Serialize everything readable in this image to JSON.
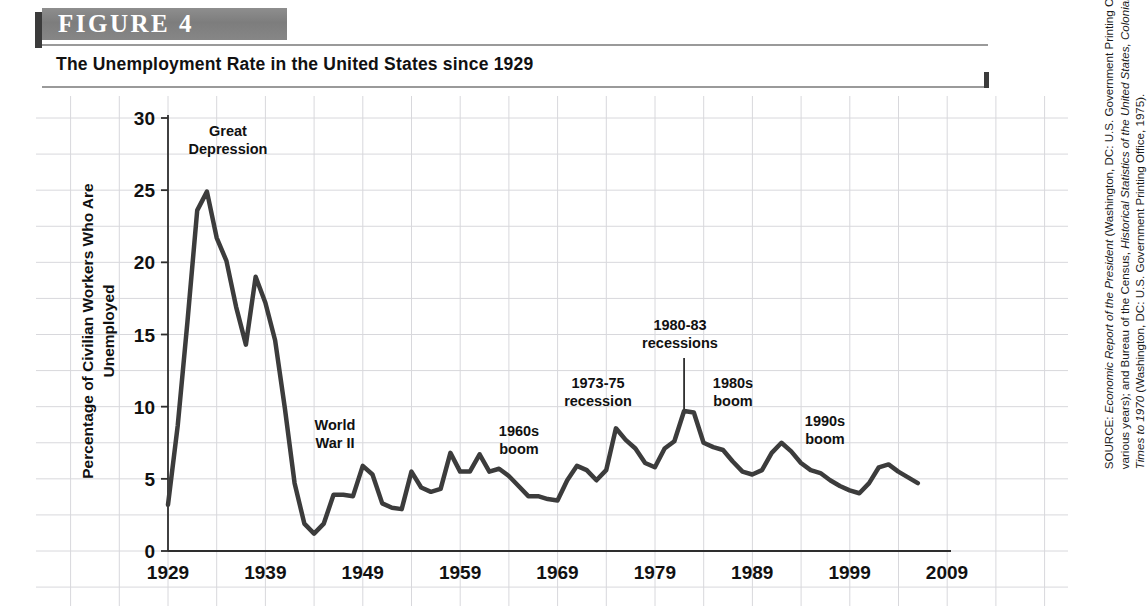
{
  "figure": {
    "label": "FIGURE   4",
    "title": "The Unemployment Rate in the United States since 1929",
    "header_band_color": "#7d7d7d",
    "header_tab_color": "#3b3b3b",
    "rule_color": "#9a9a9a"
  },
  "source": {
    "prefix": "SOURCE: ",
    "part1_italic": "Economic Report of the President",
    "part2": " (Washington, DC: U.S. Government Printing Office, various years); and Bureau of the Census, ",
    "part3_italic": "Historical Statistics of the United States, Colonial Times to 1970",
    "part4": " (Washington, DC: U.S. Government Printing Office, 1975)."
  },
  "annotations": {
    "great_depression": "Great\nDepression",
    "world_war_ii": "World\nWar II",
    "boom_1960s": "1960s\nboom",
    "recession_1973_75": "1973-75\nrecession",
    "recessions_1980_83": "1980-83\nrecessions",
    "boom_1980s": "1980s\nboom",
    "boom_1990s": "1990s\nboom"
  },
  "chart_data": {
    "type": "line",
    "title": "The Unemployment Rate in the United States since 1929",
    "xlabel": "",
    "ylabel": "Percentage of Civilian Workers Who Are Unemployed",
    "xlim": [
      1929,
      2009
    ],
    "ylim": [
      0,
      30
    ],
    "yticks": [
      0,
      5,
      10,
      15,
      20,
      25,
      30
    ],
    "ytick_labels": [
      "0",
      "5",
      "10",
      "15",
      "20",
      "25",
      "30"
    ],
    "xticks": [
      1929,
      1939,
      1949,
      1959,
      1969,
      1979,
      1989,
      1999,
      2009
    ],
    "xtick_labels": [
      "1929",
      "1939",
      "1949",
      "1959",
      "1969",
      "1979",
      "1989",
      "1999",
      "2009"
    ],
    "grid": true,
    "grid_color": "#d8d8dc",
    "line_color": "#3c3c3c",
    "line_width": 4.5,
    "legend": null,
    "series": [
      {
        "name": "Unemployment rate",
        "x": [
          1929,
          1930,
          1931,
          1932,
          1933,
          1934,
          1935,
          1936,
          1937,
          1938,
          1939,
          1940,
          1941,
          1942,
          1943,
          1944,
          1945,
          1946,
          1947,
          1948,
          1949,
          1950,
          1951,
          1952,
          1953,
          1954,
          1955,
          1956,
          1957,
          1958,
          1959,
          1960,
          1961,
          1962,
          1963,
          1964,
          1965,
          1966,
          1967,
          1968,
          1969,
          1970,
          1971,
          1972,
          1973,
          1974,
          1975,
          1976,
          1977,
          1978,
          1979,
          1980,
          1981,
          1982,
          1983,
          1984,
          1985,
          1986,
          1987,
          1988,
          1989,
          1990,
          1991,
          1992,
          1993,
          1994,
          1995,
          1996,
          1997,
          1998,
          1999,
          2000,
          2001,
          2002,
          2003,
          2004,
          2005,
          2006
        ],
        "values": [
          3.2,
          8.7,
          15.9,
          23.6,
          24.9,
          21.7,
          20.1,
          16.9,
          14.3,
          19.0,
          17.2,
          14.6,
          9.9,
          4.7,
          1.9,
          1.2,
          1.9,
          3.9,
          3.9,
          3.8,
          5.9,
          5.3,
          3.3,
          3.0,
          2.9,
          5.5,
          4.4,
          4.1,
          4.3,
          6.8,
          5.5,
          5.5,
          6.7,
          5.5,
          5.7,
          5.2,
          4.5,
          3.8,
          3.8,
          3.6,
          3.5,
          4.9,
          5.9,
          5.6,
          4.9,
          5.6,
          8.5,
          7.7,
          7.1,
          6.1,
          5.8,
          7.1,
          7.6,
          9.7,
          9.6,
          7.5,
          7.2,
          7.0,
          6.2,
          5.5,
          5.3,
          5.6,
          6.8,
          7.5,
          6.9,
          6.1,
          5.6,
          5.4,
          4.9,
          4.5,
          4.2,
          4.0,
          4.7,
          5.8,
          6.0,
          5.5,
          5.1,
          4.7
        ]
      }
    ],
    "annotations": [
      {
        "label": "Great Depression",
        "x": 1933,
        "y": 24.9
      },
      {
        "label": "World War II",
        "x": 1943,
        "y": 1.9
      },
      {
        "label": "1960s boom",
        "x": 1966,
        "y": 3.8
      },
      {
        "label": "1973-75 recession",
        "x": 1975,
        "y": 8.5
      },
      {
        "label": "1980-83 recessions",
        "x": 1982,
        "y": 9.7,
        "leader_line": true
      },
      {
        "label": "1980s boom",
        "x": 1988,
        "y": 5.5
      },
      {
        "label": "1990s boom",
        "x": 1999,
        "y": 4.2
      }
    ]
  }
}
